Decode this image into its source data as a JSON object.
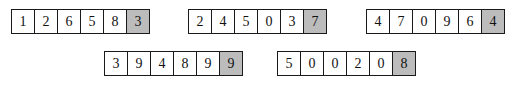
{
  "diagram": {
    "type": "digit-box-sequences",
    "colors": {
      "cell_background": "#ffffff",
      "shaded_cell_background": "#bcbcbc",
      "border": "#1a1a1a",
      "text": "#111111",
      "page_background": "#ffffff"
    },
    "groups": [
      {
        "id": "group-1",
        "row": 1,
        "position": {
          "x": 11,
          "y": 9
        },
        "digits": [
          "1",
          "2",
          "6",
          "5",
          "8",
          "3"
        ],
        "shaded_index": 5,
        "shaded_digit": "3"
      },
      {
        "id": "group-2",
        "row": 1,
        "position": {
          "x": 188,
          "y": 9
        },
        "digits": [
          "2",
          "4",
          "5",
          "0",
          "3",
          "7"
        ],
        "shaded_index": 5,
        "shaded_digit": "7"
      },
      {
        "id": "group-3",
        "row": 1,
        "position": {
          "x": 366,
          "y": 9
        },
        "digits": [
          "4",
          "7",
          "0",
          "9",
          "6",
          "4"
        ],
        "shaded_index": 5,
        "shaded_digit": "4"
      },
      {
        "id": "group-4",
        "row": 2,
        "position": {
          "x": 104,
          "y": 51
        },
        "digits": [
          "3",
          "9",
          "4",
          "8",
          "9",
          "9"
        ],
        "shaded_index": 5,
        "shaded_digit": "9"
      },
      {
        "id": "group-5",
        "row": 2,
        "position": {
          "x": 277,
          "y": 51
        },
        "digits": [
          "5",
          "0",
          "0",
          "2",
          "0",
          "8"
        ],
        "shaded_index": 5,
        "shaded_digit": "8"
      }
    ]
  }
}
